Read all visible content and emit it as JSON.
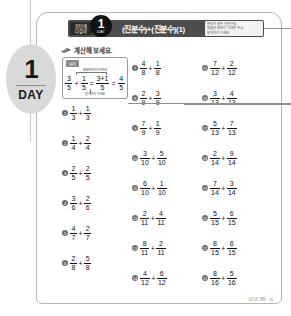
{
  "day_tab": {
    "number": "1",
    "label": "DAY"
  },
  "header": {
    "subject_line1": "한단계",
    "subject_line2": "더깊이",
    "unit_number": "1",
    "unit_label": "DAY",
    "title": "(진분수)+(진분수)(1)",
    "note_line1": "분모가 같은 진분수의",
    "note_line2": "덧셈은 분모는 그대로 두고,",
    "note_line3": "분자끼리 더해요."
  },
  "instruction": {
    "icon": "pencil-icon",
    "text": "계산해 보세요."
  },
  "example": {
    "tag": "보기",
    "caption": "분모끼리는 더하지",
    "note": "분자끼리 더해요",
    "a_num": "3",
    "a_den": "5",
    "plus": "+",
    "b_num": "1",
    "b_den": "5",
    "eq1": "=",
    "mid_num": "3+1",
    "mid_den": "5",
    "eq2": "=",
    "result_num": "4",
    "result_den": "5"
  },
  "problems": [
    {
      "n": "1",
      "a_num": "1",
      "a_den": "3",
      "op": "+",
      "b_num": "1",
      "b_den": "3"
    },
    {
      "n": "2",
      "a_num": "1",
      "a_den": "4",
      "op": "+",
      "b_num": "2",
      "b_den": "4"
    },
    {
      "n": "3",
      "a_num": "2",
      "a_den": "5",
      "op": "+",
      "b_num": "2",
      "b_den": "5"
    },
    {
      "n": "4",
      "a_num": "3",
      "a_den": "6",
      "op": "+",
      "b_num": "2",
      "b_den": "6"
    },
    {
      "n": "5",
      "a_num": "4",
      "a_den": "7",
      "op": "+",
      "b_num": "2",
      "b_den": "7"
    },
    {
      "n": "6",
      "a_num": "2",
      "a_den": "8",
      "op": "+",
      "b_num": "5",
      "b_den": "8"
    },
    {
      "n": "7",
      "a_num": "4",
      "a_den": "8",
      "op": "+",
      "b_num": "1",
      "b_den": "8"
    },
    {
      "n": "8",
      "a_num": "2",
      "a_den": "9",
      "op": "+",
      "b_num": "3",
      "b_den": "9"
    },
    {
      "n": "9",
      "a_num": "7",
      "a_den": "9",
      "op": "+",
      "b_num": "1",
      "b_den": "9"
    },
    {
      "n": "10",
      "a_num": "3",
      "a_den": "10",
      "op": "+",
      "b_num": "5",
      "b_den": "10"
    },
    {
      "n": "11",
      "a_num": "6",
      "a_den": "10",
      "op": "+",
      "b_num": "1",
      "b_den": "10"
    },
    {
      "n": "12",
      "a_num": "2",
      "a_den": "11",
      "op": "+",
      "b_num": "4",
      "b_den": "11"
    },
    {
      "n": "13",
      "a_num": "8",
      "a_den": "11",
      "op": "+",
      "b_num": "2",
      "b_den": "11"
    },
    {
      "n": "14",
      "a_num": "4",
      "a_den": "12",
      "op": "+",
      "b_num": "6",
      "b_den": "12"
    },
    {
      "n": "15",
      "a_num": "7",
      "a_den": "12",
      "op": "+",
      "b_num": "2",
      "b_den": "12"
    },
    {
      "n": "16",
      "a_num": "3",
      "a_den": "13",
      "op": "+",
      "b_num": "4",
      "b_den": "13"
    },
    {
      "n": "17",
      "a_num": "5",
      "a_den": "13",
      "op": "+",
      "b_num": "7",
      "b_den": "13"
    },
    {
      "n": "18",
      "a_num": "2",
      "a_den": "14",
      "op": "+",
      "b_num": "9",
      "b_den": "14"
    },
    {
      "n": "19",
      "a_num": "7",
      "a_den": "14",
      "op": "+",
      "b_num": "3",
      "b_den": "14"
    },
    {
      "n": "20",
      "a_num": "5",
      "a_den": "15",
      "op": "+",
      "b_num": "6",
      "b_den": "15"
    },
    {
      "n": "21",
      "a_num": "8",
      "a_den": "15",
      "op": "+",
      "b_num": "6",
      "b_den": "15"
    },
    {
      "n": "22",
      "a_num": "8",
      "a_den": "16",
      "op": "+",
      "b_num": "5",
      "b_den": "16"
    }
  ],
  "problem_layout": {
    "columns": [
      {
        "left": 0,
        "top": 48,
        "count": 6,
        "start": 0,
        "gap": 30
      },
      {
        "left": 70,
        "top": 3,
        "count": 8,
        "start": 6,
        "gap": 30
      },
      {
        "left": 140,
        "top": 3,
        "count": 8,
        "start": 14,
        "gap": 30
      }
    ]
  },
  "footer": {
    "text": "1학년 과정 · 11"
  },
  "colors": {
    "header_bar": "#4d4d4d",
    "badge": "#111111",
    "day_tab": "#d9d9d9",
    "problem_bullet": "#6b6b6b"
  }
}
